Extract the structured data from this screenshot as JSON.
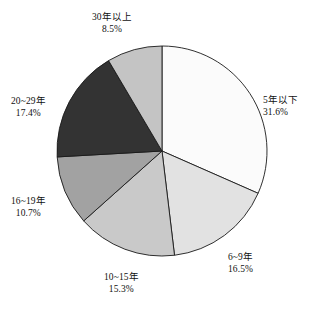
{
  "chart_data": {
    "type": "pie",
    "title": "",
    "subtitle": "",
    "xlabel": "",
    "ylabel": "",
    "legend_position": "none",
    "grid": false,
    "labels_outside": true,
    "start_angle_deg": 0,
    "direction": "clockwise",
    "geometry": {
      "center_x": 162,
      "center_y": 151,
      "radius": 105
    },
    "categories": [
      "5年以下",
      "6~9年",
      "10~15年",
      "16~19年",
      "20~29年",
      "30年以上"
    ],
    "values": [
      31.6,
      16.5,
      15.3,
      10.7,
      17.4,
      8.5
    ],
    "value_labels": [
      "31.6%",
      "16.5%",
      "15.3%",
      "10.7%",
      "17.4%",
      "8.5%"
    ],
    "colors": [
      "#fbfbfb",
      "#e2e2e2",
      "#c9c9c9",
      "#a2a2a2",
      "#333333",
      "#c4c4c4"
    ],
    "slices": [
      {
        "id": "slice-under-5-years",
        "label": "5年以下",
        "percent": 31.6,
        "percent_label": "31.6%",
        "color": "#fbfbfb",
        "start_deg": 0,
        "end_deg": 113.76,
        "label_align": "left"
      },
      {
        "id": "slice-6-9-years",
        "label": "6~9年",
        "percent": 16.5,
        "percent_label": "16.5%",
        "color": "#e2e2e2",
        "start_deg": 113.76,
        "end_deg": 173.16,
        "label_align": "left"
      },
      {
        "id": "slice-10-15-years",
        "label": "10~15年",
        "percent": 15.3,
        "percent_label": "15.3%",
        "color": "#c9c9c9",
        "start_deg": 173.16,
        "end_deg": 228.24,
        "label_align": "center"
      },
      {
        "id": "slice-16-19-years",
        "label": "16~19年",
        "percent": 10.7,
        "percent_label": "10.7%",
        "color": "#a2a2a2",
        "start_deg": 228.24,
        "end_deg": 266.76,
        "label_align": "center"
      },
      {
        "id": "slice-20-29-years",
        "label": "20~29年",
        "percent": 17.4,
        "percent_label": "17.4%",
        "color": "#333333",
        "start_deg": 266.76,
        "end_deg": 329.4,
        "label_align": "center"
      },
      {
        "id": "slice-30-plus-years",
        "label": "30年以上",
        "percent": 8.5,
        "percent_label": "8.5%",
        "color": "#c4c4c4",
        "start_deg": 329.4,
        "end_deg": 360.0,
        "label_align": "center"
      }
    ],
    "outline_color": "#1a1a1a",
    "background": "#ffffff"
  }
}
